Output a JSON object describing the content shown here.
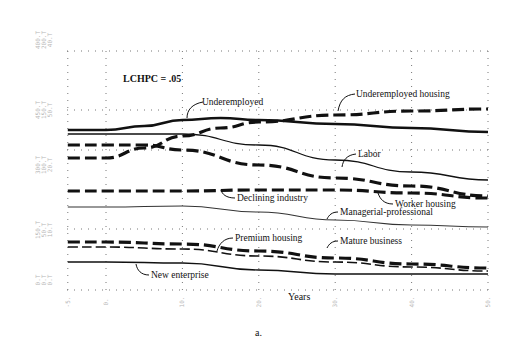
{
  "chart_data": {
    "type": "line",
    "title": "",
    "parameter_label": "LCHPC = .05",
    "xlabel": "Years",
    "ylabel": "",
    "caption": "a.",
    "xlim": [
      -5,
      50
    ],
    "x_ticks": [
      -5,
      0,
      10,
      20,
      30,
      40,
      50
    ],
    "x_tick_labels": [
      "-5.",
      "0.",
      "10.",
      "20.",
      "30.",
      "40.",
      "50."
    ],
    "left_scale_labels": [
      {
        "group": "top",
        "values": [
          "400.T",
          "200.T",
          "40.T"
        ],
        "vars": [
          "U",
          "P",
          "UH"
        ]
      },
      {
        "group": "upper-mid",
        "values": [
          "450.T",
          "150.T",
          "50.T"
        ]
      },
      {
        "group": "mid",
        "values": [
          "300.T",
          "100.T",
          "20.T"
        ]
      },
      {
        "group": "lower-mid",
        "values": [
          "150.T",
          "50.T",
          "10.T"
        ]
      },
      {
        "group": "bottom",
        "values": [
          "0.T",
          "0.T",
          "0.T"
        ]
      }
    ],
    "series": [
      {
        "name": "Underemployed",
        "style": "solid-thick",
        "x": [
          -5,
          0,
          5,
          10,
          15,
          20,
          30,
          40,
          50
        ],
        "y_px": [
          130,
          130,
          126,
          120,
          118,
          120,
          124,
          128,
          132
        ]
      },
      {
        "name": "Underemployed housing",
        "style": "dashed-thick",
        "x": [
          -5,
          0,
          5,
          10,
          15,
          20,
          30,
          40,
          50
        ],
        "y_px": [
          158,
          158,
          148,
          136,
          128,
          122,
          115,
          111,
          109
        ]
      },
      {
        "name": "Labor",
        "style": "solid-thin",
        "x": [
          -5,
          0,
          5,
          10,
          20,
          30,
          40,
          50
        ],
        "y_px": [
          134,
          134,
          134,
          134,
          145,
          160,
          172,
          180
        ]
      },
      {
        "name": "Worker housing",
        "style": "dashed-thick",
        "x": [
          -5,
          0,
          5,
          10,
          20,
          30,
          40,
          50
        ],
        "y_px": [
          145,
          145,
          145,
          150,
          165,
          178,
          186,
          196
        ]
      },
      {
        "name": "Declining industry",
        "style": "dashed-thick",
        "x": [
          -5,
          0,
          10,
          20,
          30,
          40,
          50
        ],
        "y_px": [
          191,
          191,
          191,
          190,
          190,
          193,
          198
        ]
      },
      {
        "name": "Managerial-professional",
        "style": "solid-thin-grey",
        "x": [
          -5,
          0,
          10,
          20,
          30,
          40,
          50
        ],
        "y_px": [
          207,
          207,
          206,
          212,
          220,
          225,
          227
        ]
      },
      {
        "name": "Premium housing",
        "style": "dashed-thick",
        "x": [
          -5,
          0,
          10,
          20,
          30,
          40,
          50
        ],
        "y_px": [
          242,
          242,
          244,
          251,
          258,
          264,
          268
        ]
      },
      {
        "name": "Mature business",
        "style": "dashed-thin",
        "x": [
          -5,
          0,
          10,
          20,
          30,
          40,
          50
        ],
        "y_px": [
          247,
          247,
          249,
          256,
          262,
          267,
          271
        ]
      },
      {
        "name": "New enterprise",
        "style": "solid-thin",
        "x": [
          -5,
          0,
          10,
          20,
          30,
          40,
          50
        ],
        "y_px": [
          262,
          262,
          263,
          270,
          274,
          274,
          274
        ]
      }
    ],
    "annotations": [
      {
        "text": "Underemployed",
        "x": 202,
        "y": 105
      },
      {
        "text": "Underemployed housing",
        "x": 356,
        "y": 97
      },
      {
        "text": "Labor",
        "x": 358,
        "y": 157
      },
      {
        "text": "Worker housing",
        "x": 395,
        "y": 207
      },
      {
        "text": "Declining industry",
        "x": 237,
        "y": 201
      },
      {
        "text": "Managerial-professional",
        "x": 340,
        "y": 215
      },
      {
        "text": "Premium housing",
        "x": 235,
        "y": 241
      },
      {
        "text": "Mature business",
        "x": 340,
        "y": 244
      },
      {
        "text": "New enterprise",
        "x": 151,
        "y": 278
      }
    ],
    "grid": true,
    "legend_position": "inline-annotations"
  }
}
